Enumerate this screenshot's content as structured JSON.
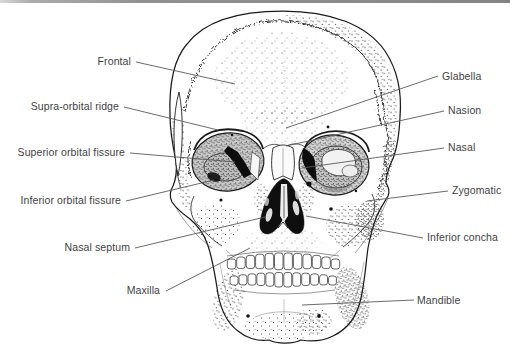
{
  "labels": {
    "left": [
      {
        "text": "Frontal"
      },
      {
        "text": "Supra-orbital ridge"
      },
      {
        "text": "Superior orbital fissure"
      },
      {
        "text": "Inferior orbital fissure"
      },
      {
        "text": "Nasal septum"
      },
      {
        "text": "Maxilla"
      }
    ],
    "right": [
      {
        "text": "Glabella"
      },
      {
        "text": "Nasion"
      },
      {
        "text": "Nasal"
      },
      {
        "text": "Zygomatic"
      },
      {
        "text": "Inferior concha"
      },
      {
        "text": "Mandible"
      }
    ]
  },
  "colors": {
    "background": "#ffffff",
    "ink": "#1a1a1a",
    "leader_line": "#5a5a5a",
    "label_text": "#3f3f3f",
    "top_rule": "#8e8e8e"
  }
}
